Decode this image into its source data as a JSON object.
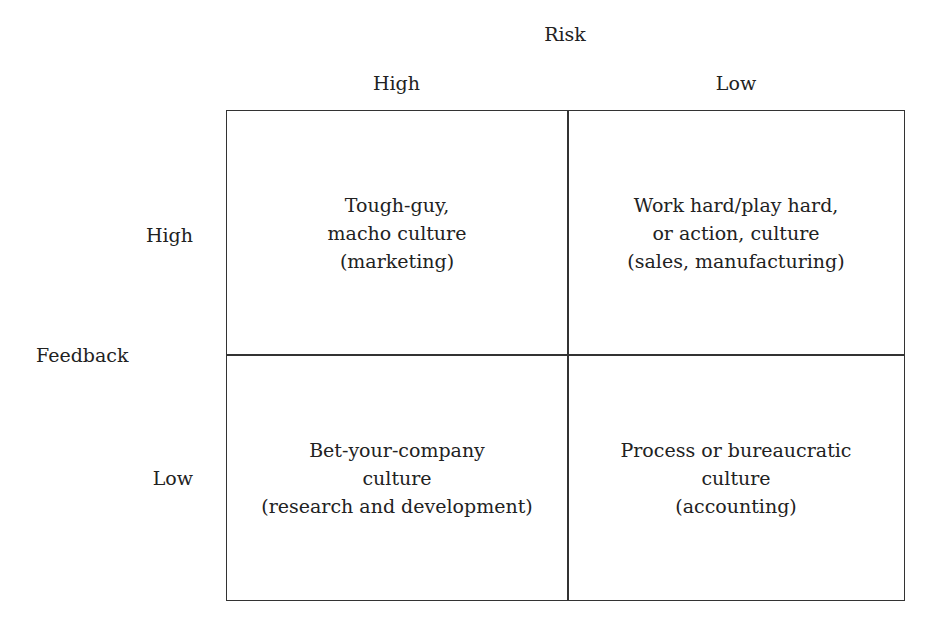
{
  "axes": {
    "top": {
      "title": "Risk",
      "high_label": "High",
      "low_label": "Low"
    },
    "left": {
      "title": "Feedback",
      "high_label": "High",
      "low_label": "Low"
    }
  },
  "quadrants": {
    "top_left": {
      "line1": "Tough-guy,",
      "line2": "macho culture",
      "line3": "(marketing)"
    },
    "top_right": {
      "line1": "Work hard/play hard,",
      "line2": "or action, culture",
      "line3": "(sales, manufacturing)"
    },
    "bottom_left": {
      "line1": "Bet-your-company",
      "line2": "culture",
      "line3": "(research and development)"
    },
    "bottom_right": {
      "line1": "Process or bureaucratic",
      "line2": "culture",
      "line3": "(accounting)"
    }
  },
  "colors": {
    "line": "#333333",
    "text": "#222222",
    "background": "#ffffff"
  }
}
